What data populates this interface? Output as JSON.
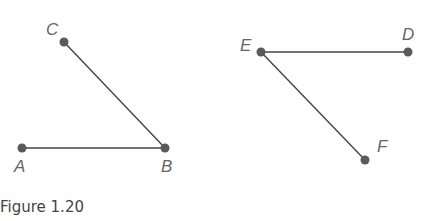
{
  "figure": {
    "caption": "Figure 1.20",
    "line_color": "#444444",
    "point_color": "#5a5a5a",
    "label_color": "#666666",
    "angles": [
      {
        "name": "angle-ABC",
        "points": [
          {
            "label": "A",
            "x": 22,
            "y": 148,
            "lx": 14,
            "ly": 172
          },
          {
            "label": "B",
            "x": 165,
            "y": 148,
            "lx": 161,
            "ly": 172
          },
          {
            "label": "C",
            "x": 64,
            "y": 42,
            "lx": 46,
            "ly": 35
          }
        ],
        "segments": [
          [
            "A",
            "B"
          ],
          [
            "B",
            "C"
          ]
        ]
      },
      {
        "name": "angle-DEF",
        "points": [
          {
            "label": "E",
            "x": 261,
            "y": 52,
            "lx": 240,
            "ly": 51
          },
          {
            "label": "D",
            "x": 408,
            "y": 52,
            "lx": 402,
            "ly": 40
          },
          {
            "label": "F",
            "x": 365,
            "y": 160,
            "lx": 377,
            "ly": 152
          }
        ],
        "segments": [
          [
            "E",
            "D"
          ],
          [
            "E",
            "F"
          ]
        ]
      }
    ]
  }
}
